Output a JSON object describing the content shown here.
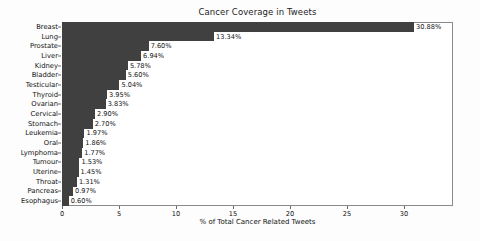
{
  "chart_data": {
    "type": "bar",
    "orientation": "horizontal",
    "title": "Cancer Coverage in Tweets",
    "xlabel": "% of Total Cancer Related Tweets",
    "ylabel": "",
    "xlim": [
      0,
      34.3
    ],
    "xticks": [
      0,
      5,
      10,
      15,
      20,
      25,
      30
    ],
    "xtick_labels": [
      "0",
      "5",
      "10",
      "15",
      "20",
      "25",
      "30"
    ],
    "grid": false,
    "legend": false,
    "bar_color": "#404040",
    "frame_color": "#8a8a8a",
    "background": "#ffffff",
    "categories": [
      "Breast",
      "Lung",
      "Prostate",
      "Liver",
      "Kidney",
      "Bladder",
      "Testicular",
      "Thyroid",
      "Ovarian",
      "Cervical",
      "Stomach",
      "Leukemia",
      "Oral",
      "Lymphoma",
      "Tumour",
      "Uterine",
      "Throat",
      "Pancreas",
      "Esophagus"
    ],
    "values": [
      30.88,
      13.34,
      7.6,
      6.94,
      5.78,
      5.6,
      5.04,
      3.95,
      3.83,
      2.9,
      2.7,
      1.97,
      1.86,
      1.77,
      1.53,
      1.45,
      1.31,
      0.97,
      0.6
    ],
    "value_labels": [
      "30.88%",
      "13.34%",
      "7.60%",
      "6.94%",
      "5.78%",
      "5.60%",
      "5.04%",
      "3.95%",
      "3.83%",
      "2.90%",
      "2.70%",
      "1.97%",
      "1.86%",
      "1.77%",
      "1.53%",
      "1.45%",
      "1.31%",
      "0.97%",
      "0.60%"
    ]
  }
}
